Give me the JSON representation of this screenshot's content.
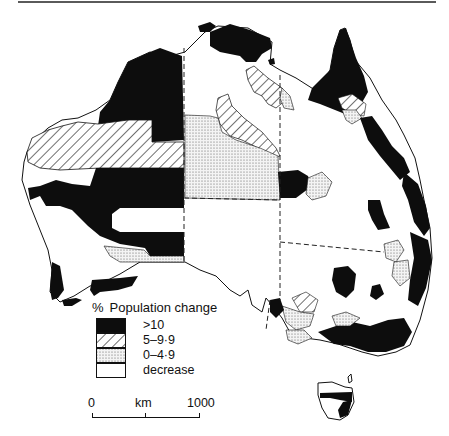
{
  "map": {
    "subject": "Australia — population change by local area",
    "legend": {
      "title_symbol": "%",
      "title": "Population change",
      "items": [
        {
          "label": ">10",
          "pattern": "solid-black",
          "color": "#0d0d0d"
        },
        {
          "label": "5–9·9",
          "pattern": "diagonal-hatch",
          "color": "#3a3a3a"
        },
        {
          "label": "0–4·9",
          "pattern": "stipple",
          "color": "#9a9a9a"
        },
        {
          "label": "decrease",
          "pattern": "blank",
          "color": "#ffffff"
        }
      ]
    },
    "scale_bar": {
      "start": "0",
      "unit": "km",
      "end": "1000"
    },
    "features": {
      "state_boundaries": "dashed",
      "tasmania_inset": true
    }
  }
}
